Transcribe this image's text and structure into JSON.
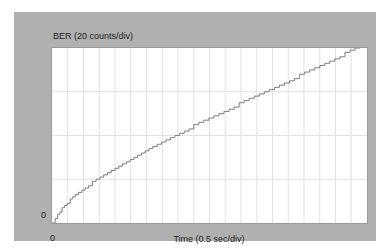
{
  "panel": {
    "background_color": "#b0b0b0",
    "plot_background_color": "#ffffff",
    "frame_color": "#9a9a9a"
  },
  "labels": {
    "y_axis_title": "BER (20 counts/div)",
    "x_axis_title": "Time (0.5 sec/div)",
    "y_origin": "0",
    "x_origin": "0"
  },
  "chart_data": {
    "type": "line",
    "title": "",
    "subtitle": "",
    "xlabel": "Time (0.5 sec/div)",
    "ylabel": "BER (20 counts/div)",
    "xlim": [
      0,
      10
    ],
    "ylim": [
      0,
      80
    ],
    "x_tick_labels": [
      "0"
    ],
    "y_tick_labels": [
      "0"
    ],
    "x_major_per_div": 0.5,
    "y_major_per_div": 20,
    "x_divisions": 20,
    "y_divisions": 4,
    "grid": true,
    "grid_color": "#e2e2e2",
    "legend": false,
    "legend_position": "none",
    "line_color": "#7d7d7d",
    "line_width": 1,
    "interpolation": "step-after",
    "annotations": [],
    "series": [
      {
        "name": "BER cumulative error count",
        "x": [
          0.0,
          0.1,
          0.18,
          0.25,
          0.32,
          0.4,
          0.48,
          0.58,
          0.66,
          0.74,
          0.84,
          0.95,
          1.05,
          1.16,
          1.28,
          1.4,
          1.52,
          1.64,
          1.76,
          1.88,
          2.0,
          2.12,
          2.24,
          2.36,
          2.48,
          2.6,
          2.72,
          2.84,
          2.96,
          3.08,
          3.2,
          3.34,
          3.48,
          3.62,
          3.76,
          3.9,
          4.05,
          4.2,
          4.35,
          4.5,
          4.66,
          4.82,
          4.98,
          5.14,
          5.3,
          5.46,
          5.62,
          5.78,
          5.94,
          6.1,
          6.26,
          6.42,
          6.58,
          6.74,
          6.9,
          7.06,
          7.22,
          7.38,
          7.54,
          7.7,
          7.86,
          8.02,
          8.18,
          8.34,
          8.5,
          8.66,
          8.82,
          8.98,
          9.14,
          9.3,
          9.46,
          9.62,
          9.78,
          9.94,
          10.0
        ],
        "y": [
          0,
          2,
          4,
          5,
          7,
          8,
          9,
          11,
          12,
          13,
          14,
          15,
          16,
          17,
          19,
          20,
          21,
          22,
          23,
          24,
          25,
          26,
          27,
          28,
          29,
          30,
          31,
          32,
          33,
          34,
          35,
          36,
          37,
          38,
          39,
          40,
          41,
          42,
          43,
          45,
          46,
          47,
          48,
          49,
          50,
          51,
          52,
          53,
          55,
          56,
          57,
          58,
          59,
          60,
          61,
          62,
          63,
          64,
          65,
          66,
          68,
          69,
          70,
          71,
          72,
          73,
          74,
          75,
          76,
          78,
          79,
          80,
          82,
          83,
          85
        ]
      }
    ]
  }
}
